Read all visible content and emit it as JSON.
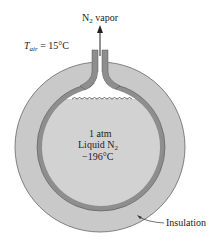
{
  "diagram": {
    "vapor_label": "N",
    "vapor_sub": "2",
    "vapor_suffix": " vapor",
    "air_label_T": "T",
    "air_label_sub": "air",
    "air_label_value": " = 15°C",
    "center_line1": "1 atm",
    "center_line2": "Liquid N",
    "center_line2_sub": "2",
    "center_line3": "−196°C",
    "insulation_label": "Insulation",
    "colors": {
      "insulation": "#c9c9c9",
      "wall": "#8e8e8e",
      "liquid": "#d2d2d2",
      "vapor_space": "#ffffff",
      "outline": "#555555"
    }
  }
}
